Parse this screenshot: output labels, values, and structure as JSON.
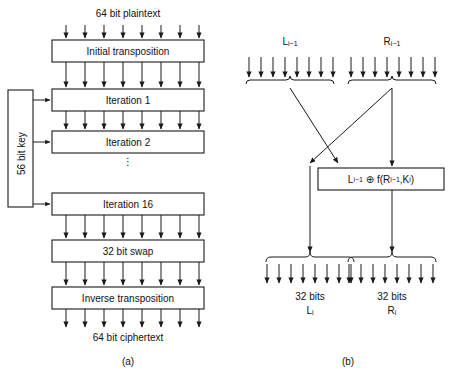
{
  "figure": {
    "panel_a": {
      "caption": "(a)",
      "top_label": "64 bit plaintext",
      "bottom_label": "64 bit ciphertext",
      "key_label": "56 bit key",
      "ellipsis": "⋮",
      "boxes": [
        {
          "id": "initial-transposition",
          "label": "Initial transposition"
        },
        {
          "id": "iteration-1",
          "label": "Iteration 1"
        },
        {
          "id": "iteration-2",
          "label": "Iteration 2"
        },
        {
          "id": "iteration-16",
          "label": "Iteration 16"
        },
        {
          "id": "bit-swap",
          "label": "32 bit swap"
        },
        {
          "id": "inverse-transposition",
          "label": "Inverse transposition"
        }
      ],
      "bus_arrow_count": 8,
      "key_arrow_count": 3
    },
    "panel_b": {
      "caption": "(b)",
      "input_left_base": "L",
      "input_left_sub": "i−1",
      "input_right_base": "R",
      "input_right_sub": "i−1",
      "formula": {
        "id": "xor-function-box",
        "left_base": "L",
        "left_sub": "i−1",
        "operator": "⊕",
        "func": "f(",
        "arg_base": "R",
        "arg_sub": "i−1",
        "comma": ", ",
        "key_base": "K",
        "key_sub": "i",
        "close": ")"
      },
      "output_left_size": "32 bits",
      "output_left_base": "L",
      "output_left_sub": "i",
      "output_right_size": "32 bits",
      "output_right_base": "R",
      "output_right_sub": "i",
      "bus_arrow_count": 8
    }
  },
  "colors": {
    "stroke": "#1a1a1a",
    "text": "#111111",
    "background": "#ffffff"
  }
}
